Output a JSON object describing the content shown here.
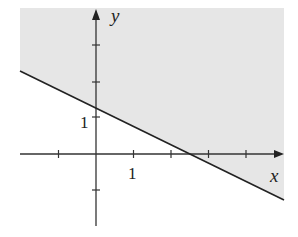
{
  "diagram": {
    "type": "linear-inequality-graph",
    "axis_labels": {
      "x": "x",
      "y": "y"
    },
    "tick_labels": {
      "x": "1",
      "y": "1"
    },
    "boundary_line": {
      "equation": "y = 1.25 - 0.5x",
      "slope": -0.5,
      "y_intercept": 1.25,
      "x_intercept": 2.5,
      "style": "solid"
    },
    "shaded_region": "above the line",
    "x_range": [
      -2,
      5
    ],
    "y_range": [
      -2,
      3.5
    ],
    "x_ticks": [
      -1,
      1,
      2,
      3,
      4
    ],
    "y_ticks": [
      -1,
      1,
      2,
      3
    ],
    "colors": {
      "shade": "#e6e6e6",
      "line": "#222222",
      "axes": "#333333"
    }
  }
}
